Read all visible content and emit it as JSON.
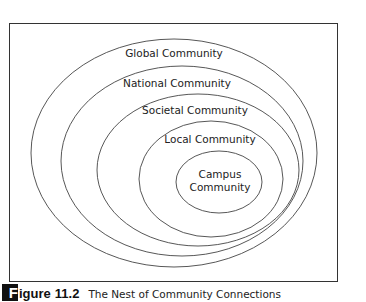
{
  "figure": {
    "caption_initial": "F",
    "caption_label": "igure",
    "caption_number": "11.2",
    "caption_title": "The Nest of Community Connections"
  },
  "diagram": {
    "type": "nested-ellipses",
    "stroke_color": "#444444",
    "rings": [
      {
        "label": "Global Community",
        "cx": 174,
        "cy": 153,
        "rx": 143,
        "ry": 114,
        "label_y": 57
      },
      {
        "label": "National Community",
        "cx": 182,
        "cy": 161,
        "rx": 121,
        "ry": 95,
        "label_y": 87
      },
      {
        "label": "Societal Community",
        "cx": 198,
        "cy": 170,
        "rx": 101,
        "ry": 76,
        "label_y": 114
      },
      {
        "label": "Local Community",
        "cx": 211,
        "cy": 179,
        "rx": 72,
        "ry": 58,
        "label_y": 143
      },
      {
        "label_lines": [
          "Campus",
          "Community"
        ],
        "cx": 219,
        "cy": 182,
        "rx": 43,
        "ry": 31,
        "label_y": 178
      }
    ]
  }
}
